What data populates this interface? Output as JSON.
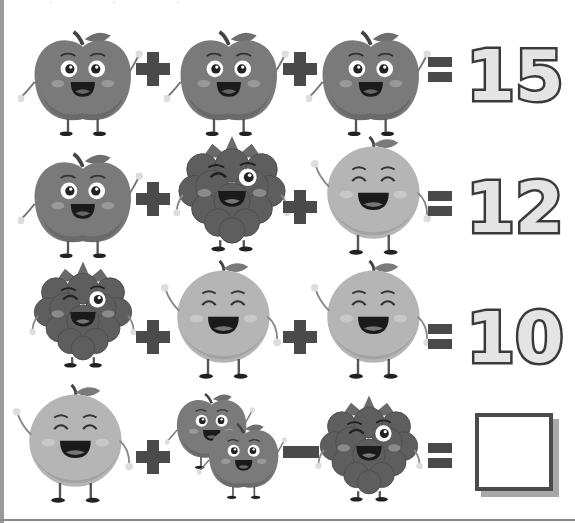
{
  "puzzle": {
    "type": "fruit-math-equations",
    "rows": [
      {
        "terms": [
          "apple",
          "apple",
          "apple"
        ],
        "operators": [
          "+",
          "+"
        ],
        "result": "15"
      },
      {
        "terms": [
          "apple",
          "raspberry",
          "orange"
        ],
        "operators": [
          "+",
          "+"
        ],
        "result": "12"
      },
      {
        "terms": [
          "raspberry",
          "orange",
          "orange"
        ],
        "operators": [
          "+",
          "+"
        ],
        "result": "10"
      },
      {
        "terms": [
          "orange",
          "two-apples",
          "raspberry"
        ],
        "operators": [
          "+",
          "-"
        ],
        "result": ""
      }
    ],
    "equals_symbol": "=",
    "answer_placeholder": ""
  },
  "colors": {
    "apple": "#7a7a7a",
    "raspberry": "#5e5e5e",
    "orange": "#b5b5b5",
    "operator": "#4a4a4a",
    "number_fill": "#e4e4e4",
    "number_stroke": "#3a3a3a"
  }
}
